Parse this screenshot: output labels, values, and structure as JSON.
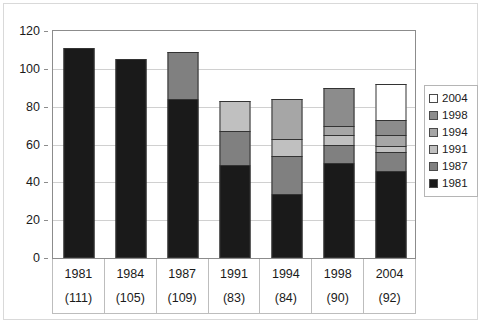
{
  "chart_data": {
    "type": "bar",
    "stacked": true,
    "title": "",
    "xlabel": "",
    "ylabel": "",
    "ylim": [
      0,
      120
    ],
    "ytick_values": [
      0,
      20,
      40,
      60,
      80,
      100,
      120
    ],
    "ytick_labels": [
      "0",
      "20",
      "40",
      "60",
      "80",
      "100",
      "120"
    ],
    "grid": true,
    "legend_position": "right",
    "categories": [
      "1981",
      "1984",
      "1987",
      "1991",
      "1994",
      "1998",
      "2004"
    ],
    "category_sublabels": [
      "(111)",
      "(105)",
      "(109)",
      "(83)",
      "(84)",
      "(90)",
      "(92)"
    ],
    "totals": [
      111,
      105,
      109,
      83,
      84,
      90,
      92
    ],
    "series": [
      {
        "name": "1981",
        "color": "#1a1a1a",
        "values": [
          111,
          105,
          84,
          49,
          34,
          50,
          46
        ]
      },
      {
        "name": "1987",
        "color": "#808080",
        "values": [
          0,
          0,
          25,
          18,
          20,
          10,
          10
        ]
      },
      {
        "name": "1991",
        "color": "#c0c0c0",
        "values": [
          0,
          0,
          0,
          16,
          9,
          5,
          3
        ]
      },
      {
        "name": "1994",
        "color": "#a6a6a6",
        "values": [
          0,
          0,
          0,
          0,
          21,
          5,
          6
        ]
      },
      {
        "name": "1998",
        "color": "#8c8c8c",
        "values": [
          0,
          0,
          0,
          0,
          0,
          20,
          8
        ]
      },
      {
        "name": "2004",
        "color": "#ffffff",
        "values": [
          0,
          0,
          0,
          0,
          0,
          0,
          19
        ]
      }
    ]
  },
  "legend": {
    "entries": [
      {
        "label": "2004",
        "color": "#ffffff"
      },
      {
        "label": "1998",
        "color": "#8c8c8c"
      },
      {
        "label": "1994",
        "color": "#a6a6a6"
      },
      {
        "label": "1991",
        "color": "#c0c0c0"
      },
      {
        "label": "1987",
        "color": "#808080"
      },
      {
        "label": "1981",
        "color": "#1a1a1a"
      }
    ]
  }
}
